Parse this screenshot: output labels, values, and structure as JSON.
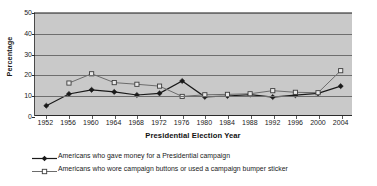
{
  "chart_data": {
    "type": "line",
    "title": "",
    "xlabel": "Presidential Election Year",
    "ylabel": "Percentage",
    "categories": [
      "1952",
      "1956",
      "1960",
      "1964",
      "1968",
      "1972",
      "1976",
      "1980",
      "1984",
      "1988",
      "1992",
      "1996",
      "2000",
      "2004"
    ],
    "ylim": [
      0,
      50
    ],
    "yticks": [
      0,
      10,
      20,
      30,
      40,
      50
    ],
    "grid": true,
    "legend_position": "bottom-left",
    "series": [
      {
        "name": "Americans who gave money for a Presidential campaign",
        "marker": "filled-diamond",
        "color": "#1a1a1a",
        "values": [
          5,
          10.7,
          12.7,
          11.7,
          10.2,
          11,
          17,
          9.3,
          9.7,
          10.4,
          9.2,
          10.1,
          11,
          14.5
        ]
      },
      {
        "name": "Americans who wore campaign buttons or used a campaign bumper sticker",
        "marker": "open-square",
        "color": "#6b6b6b",
        "values": [
          null,
          16,
          20.5,
          16.2,
          15.4,
          14.5,
          9.5,
          10.3,
          10.5,
          10.8,
          12.3,
          11.5,
          11.3,
          22
        ]
      }
    ]
  },
  "colors": {
    "plot_background": "#c9c9c9",
    "gridline": "#6e6e6e",
    "series1": "#1a1a1a",
    "series2": "#6b6b6b",
    "page_background": "#ffffff"
  }
}
